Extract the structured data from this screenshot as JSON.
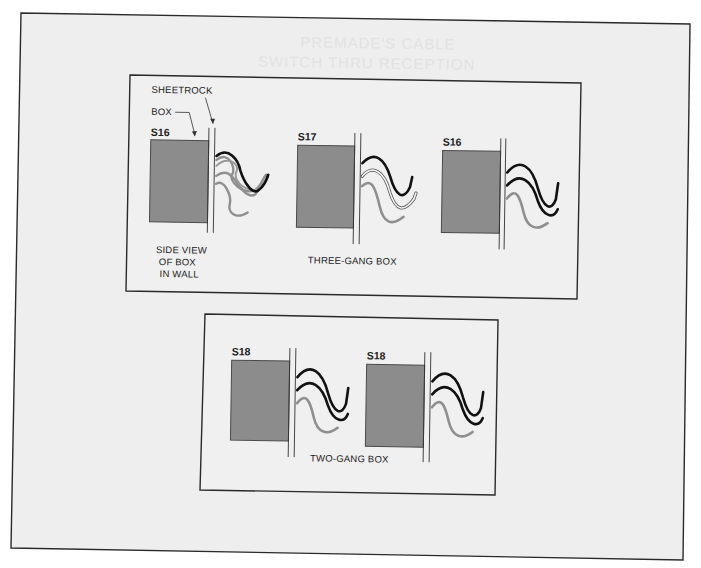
{
  "diagram": {
    "colors": {
      "page_bg": "#ffffff",
      "sheet_bg": "#eeeeee",
      "frame_line": "#2a2a2a",
      "box_fill": "#8c8c8c",
      "box_stroke": "#4a4a4a",
      "wire_black": "#111111",
      "wire_gray": "#8f8f8f",
      "wire_white_outline": "#555555"
    },
    "bleed_through_text": {
      "line1": "PREMADE'S CABLE",
      "line2": "SWITCH THRU RECEPTION"
    },
    "three_gang": {
      "caption": "THREE-GANG BOX",
      "callouts": {
        "sheetrock": "SHEETROCK",
        "box": "BOX"
      },
      "side_view_caption": {
        "line1": "SIDE  VIEW",
        "line2": "OF  BOX",
        "line3": "IN  WALL"
      },
      "boxes": [
        {
          "id": "S16"
        },
        {
          "id": "S17"
        },
        {
          "id": "S16"
        }
      ]
    },
    "two_gang": {
      "caption": "TWO-GANG  BOX",
      "boxes": [
        {
          "id": "S18"
        },
        {
          "id": "S18"
        }
      ]
    }
  }
}
